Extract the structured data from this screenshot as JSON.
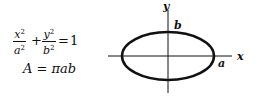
{
  "formula": {
    "ellipse_equation": {
      "term1": {
        "numerator": "x",
        "numerator_exp": "2",
        "denominator": "a",
        "denominator_exp": "2"
      },
      "plus": "+",
      "term2": {
        "numerator": "y",
        "numerator_exp": "2",
        "denominator": "b",
        "denominator_exp": "2"
      },
      "equals": "=",
      "rhs": "1"
    },
    "area_equation": {
      "lhs": "A",
      "equals": "=",
      "rhs": "πab"
    }
  },
  "diagram": {
    "x_axis_label": "x",
    "y_axis_label": "y",
    "semi_major_label": "a",
    "semi_minor_label": "b",
    "stroke_color": "#111111",
    "ellipse": {
      "cx": 168,
      "cy": 56,
      "rx": 46,
      "ry": 24
    }
  }
}
